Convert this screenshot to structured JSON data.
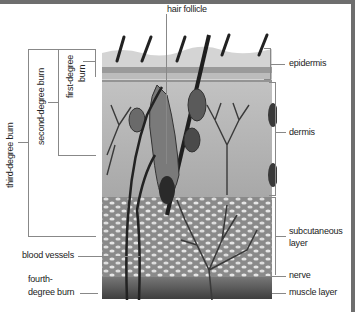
{
  "diagram": {
    "illustration": "cross-section of skin",
    "labels": {
      "hair_follicle": "hair follicle",
      "epidermis": "epidermis",
      "dermis": "dermis",
      "subcutaneous_line1": "subcutaneous",
      "subcutaneous_line2": "layer",
      "nerve": "nerve",
      "muscle_layer": "muscle layer",
      "blood_vessels": "blood vessels",
      "fourth_line1": "fourth-",
      "fourth_line2": "degree burn",
      "first_line1": "first-degree",
      "first_line2": "burn",
      "second_degree": "second-degree burn",
      "third_degree": "third-degree burn"
    },
    "colors": {
      "frame": "#6e6e6e",
      "leader_line": "#888888",
      "epidermis": "#c8c8c8",
      "dermis": "#b4b4b4",
      "subcutaneous": "#8e8e8e",
      "muscle": "#5a5a5a"
    }
  }
}
